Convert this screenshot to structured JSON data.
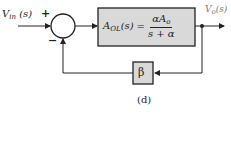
{
  "diagram": {
    "input_label": "V",
    "input_sub": "in",
    "input_arg": "(s)",
    "plus_sign": "+",
    "minus_sign": "−",
    "forward_block": {
      "lhs": "A",
      "lhs_sub": "OL",
      "lhs_arg": "(s)",
      "equals": "=",
      "numerator": "αA",
      "numerator_sub": "o",
      "denominator": "s + α"
    },
    "output_label": "V",
    "output_sub": "o",
    "output_arg": "(s)",
    "feedback_block": "β",
    "caption": "(d)",
    "colors": {
      "block_fill": "#d9d9d9",
      "line": "#222222",
      "output_label": "#777777"
    }
  }
}
